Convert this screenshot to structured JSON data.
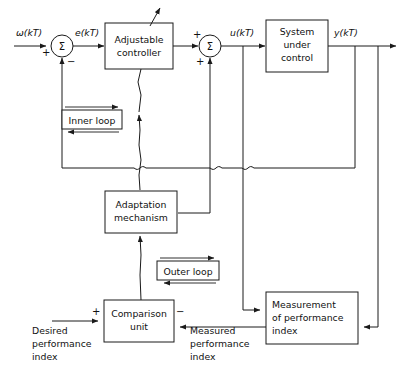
{
  "diagram": {
    "type": "block-diagram",
    "colors": {
      "line": "#1a1a1a",
      "text": "#111111",
      "background": "#ffffff"
    }
  },
  "blocks": {
    "adjustable_controller": {
      "line1": "Adjustable",
      "line2": "controller"
    },
    "system_under_control": {
      "line1": "System",
      "line2": "under",
      "line3": "control"
    },
    "adaptation_mechanism": {
      "line1": "Adaptation",
      "line2": "mechanism"
    },
    "comparison_unit": {
      "line1": "Comparison",
      "line2": "unit"
    },
    "measurement_performance_index": {
      "line1": "Measurement",
      "line2": "of performance",
      "line3": "index"
    },
    "inner_loop": {
      "label": "Inner loop"
    },
    "outer_loop": {
      "label": "Outer loop"
    }
  },
  "signals": {
    "reference": "ω(kT)",
    "error": "e(kT)",
    "control": "u(kT)",
    "output": "y(kT)"
  },
  "labels": {
    "desired_performance_index": {
      "line1": "Desired",
      "line2": "performance",
      "line3": "index"
    },
    "measured_performance_index": {
      "line1": "Measured",
      "line2": "performance",
      "line3": "index"
    }
  },
  "summing_junctions": [
    {
      "name": "error-summing-junction",
      "symbol": "Σ",
      "inputs": [
        {
          "port": "left",
          "sign": "+"
        },
        {
          "port": "bottom",
          "sign": "−"
        }
      ]
    },
    {
      "name": "control-summing-junction",
      "symbol": "Σ",
      "inputs": [
        {
          "port": "left",
          "sign": "+"
        },
        {
          "port": "bottom",
          "sign": "+"
        }
      ]
    }
  ]
}
